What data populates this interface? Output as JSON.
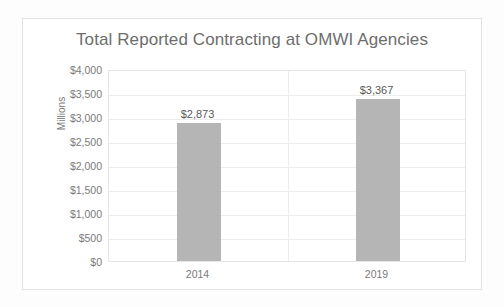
{
  "chart_data": {
    "type": "bar",
    "title": "Total Reported Contracting at OMWI Agencies",
    "xlabel": "",
    "ylabel": "Millions",
    "categories": [
      "2014",
      "2019"
    ],
    "values": [
      2873,
      3367
    ],
    "data_labels": [
      "$2,873",
      "$3,367"
    ],
    "ylim": [
      0,
      4000
    ],
    "ytick_step": 500,
    "ytick_labels": [
      "$4,000",
      "$3,500",
      "$3,000",
      "$2,500",
      "$2,000",
      "$1,500",
      "$1,000",
      "$500",
      "$0"
    ],
    "ytick_values": [
      4000,
      3500,
      3000,
      2500,
      2000,
      1500,
      1000,
      500,
      0
    ],
    "grid": true,
    "legend": false,
    "legend_position": "none",
    "series": [
      {
        "name": "Total Reported Contracting",
        "values": [
          2873,
          3367
        ],
        "color": "#b5b5b5"
      }
    ],
    "colors": {
      "bar": "#b5b5b5",
      "title_text": "#6d6d6d",
      "axis_text": "#7a7a7a",
      "data_label_text": "#595959",
      "gridline": "#ededed",
      "plot_border": "#e6e6e6",
      "card_border": "#e2e2e2",
      "background": "#ffffff"
    }
  }
}
